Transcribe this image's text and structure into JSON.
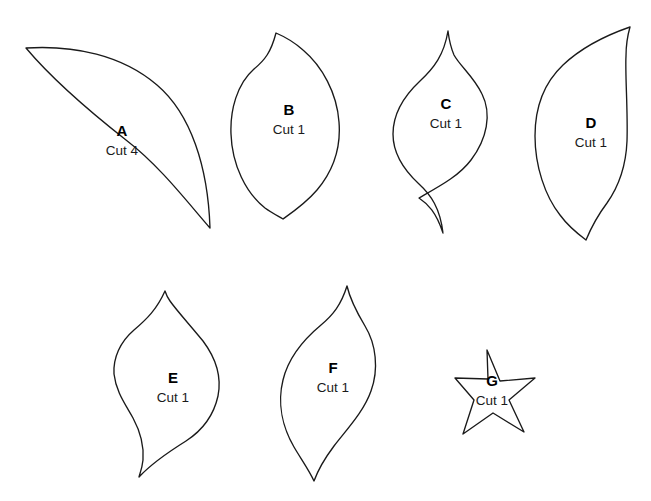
{
  "sheet": {
    "width": 651,
    "height": 501,
    "background_color": "#ffffff",
    "stroke_color": "#1a1a1a",
    "text_color": "#000000"
  },
  "pieces": [
    {
      "id": "a",
      "letter": "A",
      "cut_label": "Cut 4",
      "shape_kind": "crescent-leaf",
      "letter_x": 122,
      "letter_y": 136,
      "cut_x": 122,
      "cut_y": 155,
      "path": "M 26 48 C 74 45 122 55 157 85 C 191 114 208 167 210 228 C 188 203 160 166 126 140 C 84 107 47 73 26 48 Z"
    },
    {
      "id": "b",
      "letter": "B",
      "cut_label": "Cut 1",
      "shape_kind": "petal-point-top-left",
      "letter_x": 289,
      "letter_y": 115,
      "cut_x": 289,
      "cut_y": 134,
      "path": "M 276 33 C 271 52 265 60 254 69 C 237 84 230 110 231 134 C 232 165 246 193 265 208 C 272 213 278 216 283 219 C 293 212 306 203 317 190 C 333 171 341 147 339 122 C 337 93 322 66 303 50 C 293 41 283 36 276 33 Z"
    },
    {
      "id": "c",
      "letter": "C",
      "cut_label": "Cut 1",
      "shape_kind": "symmetric-ogee",
      "letter_x": 446,
      "letter_y": 109,
      "cut_x": 446,
      "cut_y": 128,
      "path": "M 448 31 C 444 55 434 68 420 81 C 404 96 393 114 393 134 C 393 156 406 172 419 184 C 431 195 440 208 443 233 C 436 212 428 204 419 198 C 440 186 459 176 471 160 C 487 139 492 114 482 94 C 474 77 460 66 454 55 C 451 48 449 39 448 31 Z"
    },
    {
      "id": "d",
      "letter": "D",
      "cut_label": "Cut 1",
      "shape_kind": "sickle-leaf-right-point",
      "letter_x": 591,
      "letter_y": 128,
      "cut_x": 591,
      "cut_y": 147,
      "path": "M 630 27 C 604 36 581 48 563 65 C 544 83 535 108 535 136 C 535 166 545 196 560 215 C 568 226 578 234 586 240 C 591 228 598 215 607 203 C 619 186 626 166 627 141 C 628 110 625 75 626 56 C 626 44 628 34 630 27 Z"
    },
    {
      "id": "e",
      "letter": "E",
      "cut_label": "Cut 1",
      "shape_kind": "s-curve-leaf",
      "letter_x": 173,
      "letter_y": 383,
      "cut_x": 173,
      "cut_y": 402,
      "path": "M 165 291 C 157 309 147 319 134 330 C 120 342 113 358 114 374 C 116 392 126 405 133 418 C 140 431 144 447 143 460 C 142 469 140 473 139 477 C 152 463 170 451 186 441 C 203 430 214 414 218 396 C 222 376 215 357 203 341 C 190 325 177 311 170 301 C 167 297 166 294 165 291 Z"
    },
    {
      "id": "f",
      "letter": "F",
      "cut_label": "Cut 1",
      "shape_kind": "symmetric-pointed-leaf",
      "letter_x": 333,
      "letter_y": 373,
      "cut_x": 333,
      "cut_y": 392,
      "path": "M 347 286 C 341 305 333 315 321 325 C 303 340 288 359 283 380 C 277 404 283 428 294 447 C 301 459 309 470 314 481 C 318 470 325 458 334 446 C 348 428 364 411 371 391 C 379 369 376 344 365 326 C 356 311 350 299 347 286 Z"
    },
    {
      "id": "g",
      "letter": "G",
      "cut_label": "Cut 1",
      "shape_kind": "five-point-star",
      "letter_x": 492,
      "letter_y": 386,
      "cut_x": 492,
      "cut_y": 405,
      "path": "M 487 350 L 500 381 L 535 378 L 509 400 L 524 432 L 493 413 L 463 434 L 474 400 L 455 378 L 488 379 Z"
    }
  ]
}
